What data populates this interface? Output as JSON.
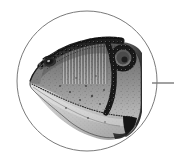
{
  "figure": {
    "kind": "scientific-illustration",
    "style": "grayscale engraving / stipple halftone",
    "background_color": "#ffffff",
    "width": 174,
    "height": 160,
    "alt_text": "Grayscale engraved illustration of a theropod dinosaur head in left profile, enclosed in a thin circular detail frame with a leader line running to the right edge.",
    "title": ""
  },
  "callout_circle": {
    "name": "detail-circle",
    "center_x": 87,
    "center_y": 81,
    "radius": 70,
    "stroke_color": "#7a7a7a",
    "stroke_width": 1,
    "fill": "none"
  },
  "leader_line": {
    "name": "callout-leader-line",
    "x1": 152,
    "y1": 83,
    "x2": 174,
    "y2": 83,
    "stroke_color": "#888888",
    "stroke_width": 1.6,
    "label": ""
  },
  "illustration": {
    "palette": {
      "outline": "#1c1c1c",
      "crest_dark": "#2a2a2a",
      "skull_upper": "#6e6e6e",
      "skull_mid": "#8d8d8d",
      "skull_lower": "#b9b9b9",
      "jaw_light": "#d2d2d2",
      "highlight": "#e8e8e8",
      "shadow": "#3d3d3d",
      "stipple": "#5a5a5a"
    },
    "parts": [
      {
        "name": "cranial-crest-ridge",
        "note": "beaded serrated ridge along top of skull"
      },
      {
        "name": "eye-socket",
        "note": "dark almond orbit with pupil, left side"
      },
      {
        "name": "orbital-ring-right",
        "note": "beaded circular opening behind skull roof"
      },
      {
        "name": "snout",
        "note": "tapering rostrum pointing left"
      },
      {
        "name": "upper-jaw-margin",
        "note": "dotted tooth-row boundary"
      },
      {
        "name": "lower-jaw",
        "note": "pale mandible sweeping to lower right"
      },
      {
        "name": "jaw-tip-shadow",
        "note": "dark pointed posterior mandible tip"
      },
      {
        "name": "neck-base",
        "note": "cropped at right edge of circle"
      }
    ]
  }
}
